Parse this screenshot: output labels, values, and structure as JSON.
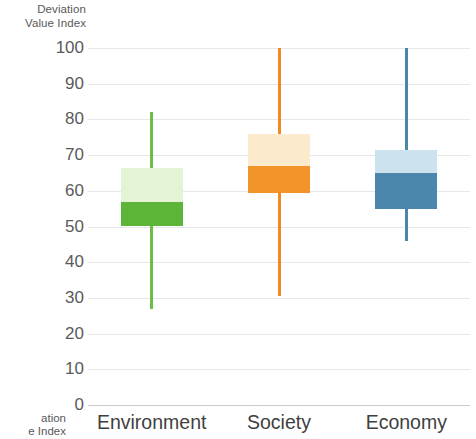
{
  "chart_data": {
    "type": "box",
    "title": "",
    "ylabel": "Deviation\nValue Index",
    "ylabel_line1": "Deviation",
    "ylabel_line2": "Value Index",
    "xlabel": "",
    "ylim": [
      0,
      100
    ],
    "ytick_step": 10,
    "yticks": [
      100,
      90,
      80,
      70,
      60,
      50,
      40,
      30,
      20,
      10,
      0
    ],
    "grid": true,
    "legend": "none",
    "categories": [
      "Environment",
      "Society",
      "Economy"
    ],
    "boxes": [
      {
        "category": "Environment",
        "color_dark": "#5CB536",
        "color_light": "#E4F3D6",
        "whisker_color": "#6CBE45",
        "whisker_low": 27,
        "q1": 50,
        "median": 57,
        "q3": 66.5,
        "whisker_high": 82
      },
      {
        "category": "Society",
        "color_dark": "#F2942A",
        "color_light": "#FBEACB",
        "whisker_color": "#EE8B22",
        "whisker_low": 30.5,
        "q1": 59.5,
        "median": 67,
        "q3": 76,
        "whisker_high": 100
      },
      {
        "category": "Economy",
        "color_dark": "#4B86AC",
        "color_light": "#CDE2EF",
        "whisker_color": "#4B86AC",
        "whisker_low": 46,
        "q1": 55,
        "median": 65,
        "q3": 71.5,
        "whisker_high": 100
      }
    ]
  },
  "clipped_caption": {
    "line1": "ation",
    "line2": "e Index"
  },
  "colors": {
    "gridline": "#e8e8ea",
    "baseline": "#c9c9cc",
    "text": "#4a4a4a"
  }
}
